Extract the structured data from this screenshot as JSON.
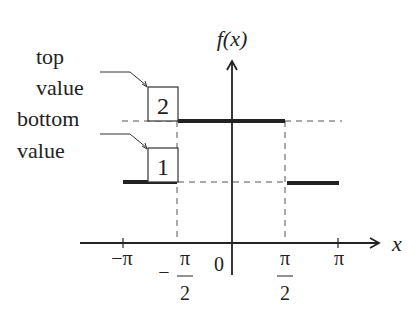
{
  "figure": {
    "y_axis_label": "f(x)",
    "x_axis_label": "x",
    "origin_label": "0",
    "ticks": {
      "neg_pi": "−π",
      "neg_pi_half_sign": "−",
      "neg_pi_half_num": "π",
      "neg_pi_half_den": "2",
      "pi_half_num": "π",
      "pi_half_den": "2",
      "pi": "π"
    },
    "annotations": {
      "top_line1": "top",
      "top_line2": "value",
      "bottom_line1": "bottom",
      "bottom_line2": "value"
    },
    "boxes": {
      "top_value": "2",
      "bottom_value": "1"
    },
    "colors": {
      "ink": "#222222",
      "dash": "#555555"
    }
  }
}
